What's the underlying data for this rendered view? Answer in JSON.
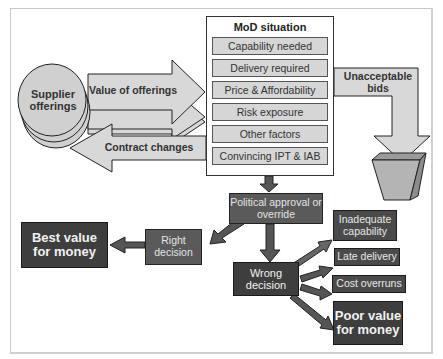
{
  "diagram": {
    "supplier": {
      "label": "Supplier offerings"
    },
    "value_arrow": {
      "label": "Value of offerings"
    },
    "contract_arrow": {
      "label": "Contract changes"
    },
    "mod_situation": {
      "title": "MoD situation",
      "items": [
        "Capability needed",
        "Delivery required",
        "Price & Affordability",
        "Risk exposure",
        "Other factors",
        "Convincing IPT & IAB"
      ]
    },
    "unacceptable": {
      "label": "Unacceptable bids"
    },
    "political": {
      "label": "Political approval or override"
    },
    "right_decision": {
      "label": "Right decision"
    },
    "best_value": {
      "label": "Best value for money"
    },
    "wrong_decision": {
      "label": "Wrong decision"
    },
    "outcomes": [
      "Inadequate capability",
      "Late delivery",
      "Cost overruns"
    ],
    "poor_value": {
      "label": "Poor value for money"
    },
    "colors": {
      "light_fill": "#d6d6d6",
      "mid_fill": "#5a5a5a",
      "dark_fill": "#4a4a4a",
      "arrow_dark": "#4d4d4d",
      "outline": "#222222"
    }
  }
}
